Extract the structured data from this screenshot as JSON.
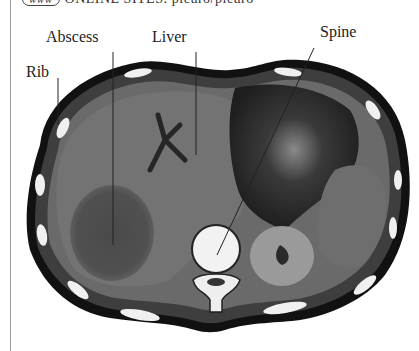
{
  "header": {
    "badge": "www",
    "text": "ONLINE SITES: pleuro/pleuro"
  },
  "figure": {
    "type": "CT axial scan of upper abdomen",
    "labels": [
      {
        "id": "abscess",
        "text": "Abscess"
      },
      {
        "id": "liver",
        "text": "Liver"
      },
      {
        "id": "spine",
        "text": "Spine"
      },
      {
        "id": "rib",
        "text": "Rib"
      }
    ]
  },
  "colors": {
    "background": "#ffffff",
    "scan_dark": "#1a1a1a",
    "soft_tissue": "#6f6f6f",
    "bone": "#f2f2f2"
  }
}
